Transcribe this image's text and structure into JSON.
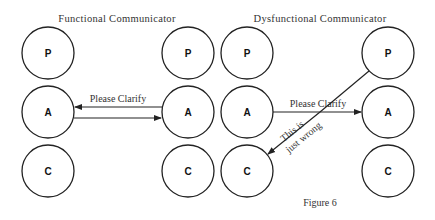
{
  "titles": {
    "left": "Functional Communicator",
    "right": "Dysfunctional Communicator"
  },
  "states": {
    "p": "P",
    "a": "A",
    "c": "C"
  },
  "messages": {
    "functional": "Please Clarify",
    "dysfunctional": "Please Clarify",
    "crossed_line1": "This is",
    "crossed_line2": "just wrong"
  },
  "caption": "Figure 6"
}
